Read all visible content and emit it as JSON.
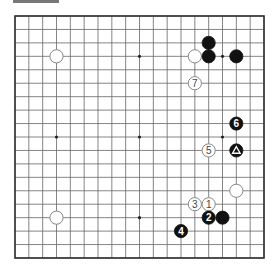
{
  "diagram": {
    "type": "go-board",
    "size": 19,
    "colors": {
      "board": "#ffffff",
      "line": "#555555",
      "black": "#111111",
      "white": "#ffffff"
    },
    "star_points": [
      [
        3,
        3
      ],
      [
        9,
        3
      ],
      [
        15,
        3
      ],
      [
        3,
        9
      ],
      [
        9,
        9
      ],
      [
        15,
        9
      ],
      [
        3,
        15
      ],
      [
        9,
        15
      ],
      [
        15,
        15
      ]
    ],
    "stones": [
      {
        "color": "white",
        "col": 3,
        "row": 3,
        "label": ""
      },
      {
        "color": "white",
        "col": 13,
        "row": 3,
        "label": ""
      },
      {
        "color": "black",
        "col": 14,
        "row": 2,
        "label": ""
      },
      {
        "color": "black",
        "col": 14,
        "row": 3,
        "label": ""
      },
      {
        "color": "black",
        "col": 16,
        "row": 3,
        "label": ""
      },
      {
        "color": "white",
        "col": 13,
        "row": 5,
        "label": "7"
      },
      {
        "color": "black",
        "col": 16,
        "row": 8,
        "label": "6"
      },
      {
        "color": "white",
        "col": 14,
        "row": 10,
        "label": "5"
      },
      {
        "color": "black",
        "col": 16,
        "row": 10,
        "label": "△"
      },
      {
        "color": "white",
        "col": 16,
        "row": 13,
        "label": ""
      },
      {
        "color": "white",
        "col": 13,
        "row": 14,
        "label": "3"
      },
      {
        "color": "white",
        "col": 14,
        "row": 14,
        "label": "1"
      },
      {
        "color": "black",
        "col": 14,
        "row": 15,
        "label": "2"
      },
      {
        "color": "black",
        "col": 15,
        "row": 15,
        "label": ""
      },
      {
        "color": "black",
        "col": 12,
        "row": 16,
        "label": "4"
      },
      {
        "color": "white",
        "col": 3,
        "row": 15,
        "label": ""
      }
    ]
  }
}
